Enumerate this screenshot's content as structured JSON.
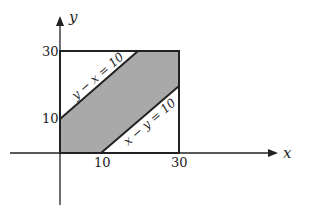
{
  "diagram": {
    "axes": {
      "x_label": "x",
      "y_label": "y"
    },
    "ticks": {
      "x": [
        "10",
        "30"
      ],
      "y": [
        "10",
        "30"
      ]
    },
    "lines": [
      {
        "equation": "y − x = 10"
      },
      {
        "equation": "x − y = 10"
      }
    ],
    "region": {
      "description": "shaded band between y − x = 10 and x − y = 10 within square 0 ≤ x ≤ 30, 0 ≤ y ≤ 30",
      "fill_color": "#a9a9a9"
    },
    "square": {
      "x_max": 30,
      "y_max": 30
    }
  }
}
